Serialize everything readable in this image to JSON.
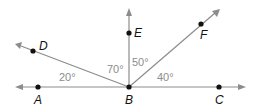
{
  "diagram": {
    "type": "angles-at-a-point",
    "vertex": {
      "label": "B",
      "x": 129,
      "y": 87
    },
    "points": [
      {
        "label": "A",
        "x": 38,
        "y": 87
      },
      {
        "label": "C",
        "x": 219,
        "y": 87
      },
      {
        "label": "D",
        "x": 33,
        "y": 51
      },
      {
        "label": "E",
        "x": 129,
        "y": 33
      },
      {
        "label": "F",
        "x": 201,
        "y": 24
      }
    ],
    "angles": [
      {
        "between": "A-B-D",
        "label": "20°"
      },
      {
        "between": "D-B-E",
        "label": "70°"
      },
      {
        "between": "E-B-F",
        "label": "50°"
      },
      {
        "between": "F-B-C",
        "label": "40°"
      }
    ],
    "colors": {
      "ray": "#8c8c8c",
      "point": "#111111",
      "angle_text": "#8c8c8c"
    }
  }
}
